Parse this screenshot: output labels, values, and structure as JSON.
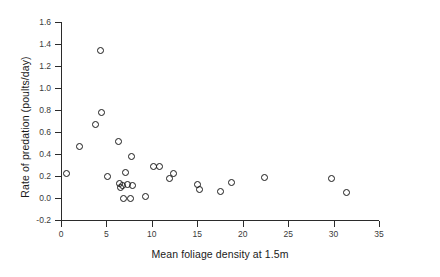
{
  "chart_data": {
    "type": "scatter",
    "title": "",
    "xlabel": "Mean foliage density at 1.5m",
    "ylabel": "Rate of predation (poults/day)",
    "xlim": [
      0,
      35
    ],
    "ylim": [
      -0.2,
      1.6
    ],
    "xticks": [
      0,
      5,
      10,
      15,
      20,
      25,
      30,
      35
    ],
    "xtick_labels": [
      "0",
      "5",
      "10",
      "15",
      "20",
      "25",
      "30",
      "35"
    ],
    "yticks": [
      -0.2,
      0.0,
      0.2,
      0.4,
      0.6,
      0.8,
      1.0,
      1.2,
      1.4,
      1.6
    ],
    "ytick_labels": [
      "-0.2",
      "0.0",
      "0.2",
      "0.4",
      "0.6",
      "0.8",
      "1.0",
      "1.2",
      "1.4",
      "1.6"
    ],
    "grid": false,
    "legend": null,
    "marker": "open-circle",
    "marker_color": "#1a1a1a",
    "points": [
      {
        "x": 0.6,
        "y": 0.22
      },
      {
        "x": 2.0,
        "y": 0.47
      },
      {
        "x": 3.8,
        "y": 0.67
      },
      {
        "x": 4.4,
        "y": 1.34
      },
      {
        "x": 4.5,
        "y": 0.78
      },
      {
        "x": 5.1,
        "y": 0.2
      },
      {
        "x": 6.3,
        "y": 0.51
      },
      {
        "x": 6.4,
        "y": 0.13
      },
      {
        "x": 6.6,
        "y": 0.1
      },
      {
        "x": 6.8,
        "y": 0.11
      },
      {
        "x": 6.9,
        "y": 0.0
      },
      {
        "x": 7.1,
        "y": 0.23
      },
      {
        "x": 7.3,
        "y": 0.12
      },
      {
        "x": 7.6,
        "y": 0.0
      },
      {
        "x": 7.8,
        "y": 0.38
      },
      {
        "x": 7.9,
        "y": 0.11
      },
      {
        "x": 9.3,
        "y": 0.01
      },
      {
        "x": 10.2,
        "y": 0.29
      },
      {
        "x": 10.8,
        "y": 0.29
      },
      {
        "x": 11.9,
        "y": 0.18
      },
      {
        "x": 12.4,
        "y": 0.22
      },
      {
        "x": 15.0,
        "y": 0.12
      },
      {
        "x": 15.2,
        "y": 0.08
      },
      {
        "x": 17.5,
        "y": 0.06
      },
      {
        "x": 18.8,
        "y": 0.14
      },
      {
        "x": 22.4,
        "y": 0.19
      },
      {
        "x": 29.8,
        "y": 0.18
      },
      {
        "x": 31.4,
        "y": 0.05
      }
    ]
  }
}
